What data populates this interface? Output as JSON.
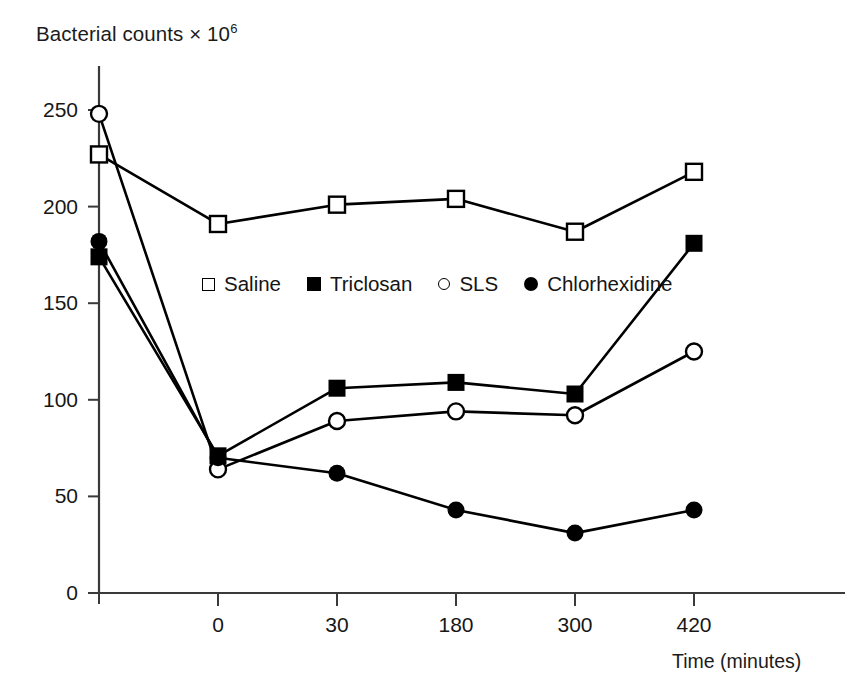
{
  "chart_data": {
    "type": "line",
    "title": "",
    "ylabel": "Bacterial counts × 10",
    "ylabel_exponent": "6",
    "xlabel": "Time (minutes)",
    "categories": [
      "",
      "0",
      "30",
      "180",
      "300",
      "420"
    ],
    "x_tick_labels": [
      "",
      "0",
      "30",
      "180",
      "300",
      "420"
    ],
    "y_tick_labels": [
      "0",
      "50",
      "100",
      "150",
      "200",
      "250"
    ],
    "ylim": [
      0,
      268
    ],
    "yticks": [
      0,
      50,
      100,
      150,
      200,
      250
    ],
    "grid": false,
    "legend_position": "inside-upper-center",
    "series": [
      {
        "name": "Saline",
        "marker": "open-square",
        "values": [
          227,
          191,
          201,
          204,
          187,
          218
        ]
      },
      {
        "name": "Triclosan",
        "marker": "filled-square",
        "values": [
          174,
          71,
          106,
          109,
          103,
          181
        ]
      },
      {
        "name": "SLS",
        "marker": "open-circle",
        "values": [
          248,
          64,
          89,
          94,
          92,
          125
        ]
      },
      {
        "name": "Chlorhexidine",
        "marker": "filled-circle",
        "values": [
          182,
          70,
          62,
          43,
          31,
          43
        ]
      }
    ]
  },
  "axes": {
    "y_title_text": "Bacterial counts × 10",
    "y_title_sup": "6",
    "x_title_text": "Time (minutes)",
    "y_ticks": [
      {
        "label": "250",
        "value": 250
      },
      {
        "label": "200",
        "value": 200
      },
      {
        "label": "150",
        "value": 150
      },
      {
        "label": "100",
        "value": 100
      },
      {
        "label": "50",
        "value": 50
      },
      {
        "label": "0",
        "value": 0
      }
    ],
    "x_ticks": [
      {
        "label": "0",
        "index": 1
      },
      {
        "label": "30",
        "index": 2
      },
      {
        "label": "180",
        "index": 3
      },
      {
        "label": "300",
        "index": 4
      },
      {
        "label": "420",
        "index": 5
      }
    ]
  },
  "legend": {
    "entries": [
      {
        "label": "Saline",
        "marker": "open-square"
      },
      {
        "label": "Triclosan",
        "marker": "filled-square"
      },
      {
        "label": "SLS",
        "marker": "open-circle"
      },
      {
        "label": "Chlorhexidine",
        "marker": "filled-circle"
      }
    ]
  },
  "colors": {
    "ink": "#000000",
    "text": "#161616",
    "background": "#ffffff",
    "axis": "#3a3a3a"
  }
}
